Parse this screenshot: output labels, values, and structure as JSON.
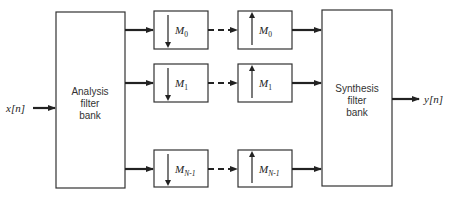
{
  "diagram": {
    "type": "block-diagram",
    "input_label": "x[n]",
    "output_label": "y[n]",
    "analysis": {
      "line1": "Analysis",
      "line2": "filter",
      "line3": "bank"
    },
    "synthesis": {
      "line1": "Synthesis",
      "line2": "filter",
      "line3": "bank"
    },
    "channels": [
      {
        "down_symbol": "M",
        "down_sub": "0",
        "up_symbol": "M",
        "up_sub": "0"
      },
      {
        "down_symbol": "M",
        "down_sub": "1",
        "up_symbol": "M",
        "up_sub": "1"
      },
      {
        "down_symbol": "M",
        "down_sub": "N-1",
        "up_symbol": "M",
        "up_sub": "N-1"
      }
    ],
    "colors": {
      "stroke": "#222222",
      "background": "#ffffff"
    }
  }
}
